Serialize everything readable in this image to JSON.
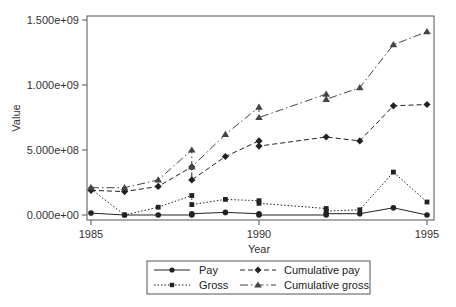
{
  "chart_data": {
    "type": "line",
    "title": "",
    "xlabel": "Year",
    "ylabel": "Value",
    "xlim": [
      1985,
      1995
    ],
    "ylim": [
      0,
      1500000000
    ],
    "x_ticks": [
      1985,
      1990,
      1995
    ],
    "x_tick_labels": [
      "1985",
      "1990",
      "1995"
    ],
    "y_ticks": [
      0,
      500000000,
      1000000000,
      1500000000
    ],
    "y_tick_labels": [
      "0.000e+00",
      "5.000e+08",
      "1.000e+09",
      "1.500e+09"
    ],
    "grid": false,
    "legend_position": "bottom",
    "series": [
      {
        "name": "Pay",
        "line_style": "solid",
        "marker": "circle",
        "color": "#222222",
        "points": [
          [
            1985,
            15000000
          ],
          [
            1986,
            0
          ],
          [
            1987,
            0
          ],
          [
            1988,
            0
          ],
          [
            1988,
            10000000
          ],
          [
            1989,
            20000000
          ],
          [
            1990,
            10000000
          ],
          [
            1990,
            0
          ],
          [
            1992,
            0
          ],
          [
            1992,
            10000000
          ],
          [
            1993,
            10000000
          ],
          [
            1994,
            55000000
          ],
          [
            1995,
            0
          ]
        ]
      },
      {
        "name": "Gross",
        "line_style": "dotted",
        "marker": "square",
        "color": "#222222",
        "points": [
          [
            1985,
            200000000
          ],
          [
            1986,
            0
          ],
          [
            1987,
            60000000
          ],
          [
            1988,
            150000000
          ],
          [
            1988,
            80000000
          ],
          [
            1989,
            120000000
          ],
          [
            1990,
            110000000
          ],
          [
            1990,
            90000000
          ],
          [
            1992,
            50000000
          ],
          [
            1992,
            30000000
          ],
          [
            1993,
            40000000
          ],
          [
            1994,
            330000000
          ],
          [
            1995,
            100000000
          ]
        ]
      },
      {
        "name": "Cumulative pay",
        "line_style": "dashed",
        "marker": "diamond",
        "color": "#222222",
        "points": [
          [
            1985,
            190000000
          ],
          [
            1986,
            180000000
          ],
          [
            1987,
            220000000
          ],
          [
            1988,
            370000000
          ],
          [
            1988,
            270000000
          ],
          [
            1989,
            450000000
          ],
          [
            1990,
            570000000
          ],
          [
            1990,
            530000000
          ],
          [
            1992,
            600000000
          ],
          [
            1993,
            570000000
          ],
          [
            1994,
            840000000
          ],
          [
            1995,
            850000000
          ]
        ]
      },
      {
        "name": "Cumulative gross",
        "line_style": "dashdot",
        "marker": "triangle",
        "color": "#444444",
        "points": [
          [
            1985,
            210000000
          ],
          [
            1986,
            210000000
          ],
          [
            1987,
            270000000
          ],
          [
            1988,
            500000000
          ],
          [
            1988,
            370000000
          ],
          [
            1989,
            620000000
          ],
          [
            1990,
            830000000
          ],
          [
            1990,
            750000000
          ],
          [
            1992,
            930000000
          ],
          [
            1992,
            890000000
          ],
          [
            1993,
            980000000
          ],
          [
            1994,
            1310000000
          ],
          [
            1995,
            1410000000
          ]
        ]
      }
    ]
  },
  "legend": {
    "items": [
      {
        "label": "Pay"
      },
      {
        "label": "Cumulative pay"
      },
      {
        "label": "Gross"
      },
      {
        "label": "Cumulative gross"
      }
    ]
  }
}
